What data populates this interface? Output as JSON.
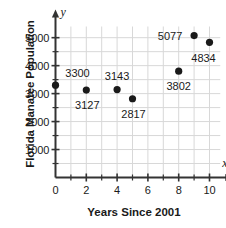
{
  "chart_data": {
    "type": "scatter",
    "title": "",
    "xlabel": "Years Since 2001",
    "ylabel": "Florida Manatee Population",
    "x_var_symbol": "x",
    "y_var_symbol": "y",
    "xlim": [
      0,
      10.7
    ],
    "ylim": [
      0,
      5400
    ],
    "grid": true,
    "legend": "none",
    "x_ticks": [
      0,
      2,
      4,
      6,
      8,
      10
    ],
    "x_tick_labels": [
      "0",
      "2",
      "4",
      "6",
      "8",
      "10"
    ],
    "x_minor_ticks": [
      1,
      3,
      5,
      7,
      9
    ],
    "y_ticks": [
      1000,
      2000,
      3000,
      4000,
      5000
    ],
    "y_tick_labels": [
      "1000",
      "2000",
      "3000",
      "4000",
      "5000"
    ],
    "y_minor_ticks": [
      500,
      1500,
      2500,
      3500,
      4500
    ],
    "point_color": "#1a1a1a",
    "grid_color": "#d8d8d8",
    "axis_color": "#333333",
    "points": [
      {
        "x": 0,
        "y": 3300,
        "label": "3300",
        "label_dx": 22,
        "label_dy": -12
      },
      {
        "x": 2,
        "y": 3127,
        "label": "3127",
        "label_dx": 1,
        "label_dy": 15
      },
      {
        "x": 4,
        "y": 3143,
        "label": "3143",
        "label_dx": 0,
        "label_dy": -14
      },
      {
        "x": 5,
        "y": 2817,
        "label": "2817",
        "label_dx": 1,
        "label_dy": 15
      },
      {
        "x": 8,
        "y": 3802,
        "label": "3802",
        "label_dx": 0,
        "label_dy": 15
      },
      {
        "x": 9,
        "y": 5077,
        "label": "5077",
        "label_dx": -24,
        "label_dy": 0
      },
      {
        "x": 10,
        "y": 4834,
        "label": "4834",
        "label_dx": -6,
        "label_dy": 16
      }
    ]
  }
}
